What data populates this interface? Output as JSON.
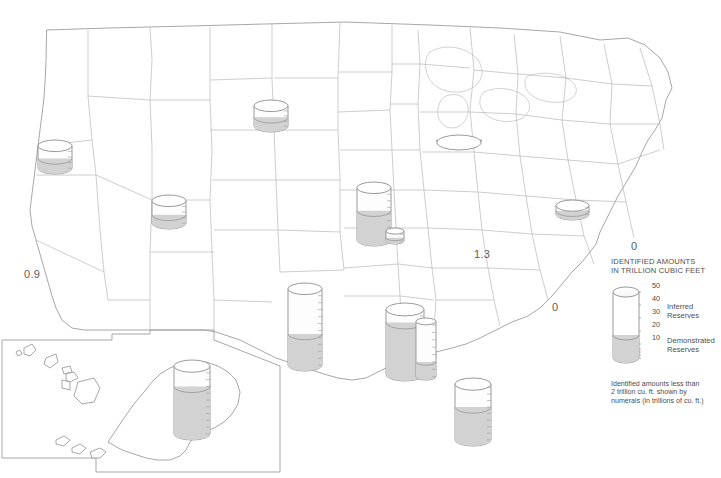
{
  "figure": {
    "kind": "thematic-map",
    "region": "United States"
  },
  "legend": {
    "title": "IDENTIFIED AMOUNTS\nIN TRILLION CUBIC FEET",
    "scale_max": 50,
    "scale_min": 0,
    "tick_labels": [
      "50",
      "40",
      "30",
      "20",
      "10"
    ],
    "tick_values": [
      50,
      40,
      30,
      20,
      10
    ],
    "categories": [
      {
        "key": "inferred",
        "label": "Inferred\nReserves",
        "color": "#ffffff"
      },
      {
        "key": "demonstrated",
        "label": "Demonstrated\nReserves",
        "color": "#d4d4d4"
      }
    ],
    "sample_demonstrated_value": 17,
    "note": "Identified amounts less than\n2 trillion cu. ft. shown by\nnumerals (in trillions of cu. ft.)"
  },
  "colors": {
    "outline": "#9a9a9a",
    "state_border": "#b5b5b5",
    "fill_demonstrated": "#d2d2d2",
    "fill_inferred": "#fdfdfd",
    "text": "#4e4e4e"
  },
  "chart_data": {
    "type": "map",
    "units": "trillion cubic feet",
    "symbol": "graduated cylinder, height proportional to total identified amount",
    "legend_max": 50,
    "cylinders": [
      {
        "name": "pacific-northwest",
        "region": "Pacific Northwest",
        "x": 38,
        "y": 140,
        "w": 34,
        "h": 34,
        "total": 8,
        "demonstrated": 3.5
      },
      {
        "name": "northern-plains",
        "region": "Northern Plains",
        "x": 254,
        "y": 100,
        "w": 34,
        "h": 32,
        "total": 8,
        "demonstrated": 3.5
      },
      {
        "name": "rocky-mountains",
        "region": "Rocky Mountains",
        "x": 152,
        "y": 195,
        "w": 34,
        "h": 34,
        "total": 8,
        "demonstrated": 3
      },
      {
        "name": "michigan-basin",
        "region": "Michigan Basin",
        "x": 437,
        "y": 135,
        "w": 44,
        "h": 12,
        "total": 3,
        "demonstrated": 1
      },
      {
        "name": "appalachian",
        "region": "Appalachian",
        "x": 556,
        "y": 200,
        "w": 33,
        "h": 20,
        "total": 5,
        "demonstrated": 2
      },
      {
        "name": "mid-continent",
        "region": "Mid-Continent",
        "x": 357,
        "y": 182,
        "w": 34,
        "h": 64,
        "total": 16,
        "demonstrated": 9
      },
      {
        "name": "arkansas",
        "region": "Arkansas",
        "x": 386,
        "y": 228,
        "w": 18,
        "h": 16,
        "total": 3,
        "demonstrated": 1
      },
      {
        "name": "texas",
        "region": "Texas",
        "x": 288,
        "y": 283,
        "w": 34,
        "h": 88,
        "total": 22,
        "demonstrated": 9
      },
      {
        "name": "louisiana",
        "region": "Louisiana",
        "x": 386,
        "y": 303,
        "w": 38,
        "h": 78,
        "total": 20,
        "demonstrated": 16
      },
      {
        "name": "mississippi-alabama",
        "region": "Mississippi-Alabama",
        "x": 416,
        "y": 318,
        "w": 20,
        "h": 62,
        "total": 15,
        "demonstrated": 4
      },
      {
        "name": "gulf-of-mexico",
        "region": "Gulf of Mexico offshore",
        "x": 455,
        "y": 378,
        "w": 36,
        "h": 68,
        "total": 17,
        "demonstrated": 10
      },
      {
        "name": "alaska",
        "region": "Alaska",
        "x": 174,
        "y": 360,
        "w": 36,
        "h": 80,
        "total": 20,
        "demonstrated": 14
      }
    ],
    "numerals": [
      {
        "name": "numeral-california",
        "label": "0.9",
        "value": 0.9,
        "x": 24,
        "y": 268
      },
      {
        "name": "numeral-kentucky-tennessee",
        "label": "1.3",
        "value": 1.3,
        "x": 474,
        "y": 248
      },
      {
        "name": "numeral-mid-atlantic",
        "label": "0",
        "value": 0,
        "x": 631,
        "y": 240
      },
      {
        "name": "numeral-southeast",
        "label": "0",
        "value": 0,
        "x": 552,
        "y": 301
      }
    ]
  }
}
